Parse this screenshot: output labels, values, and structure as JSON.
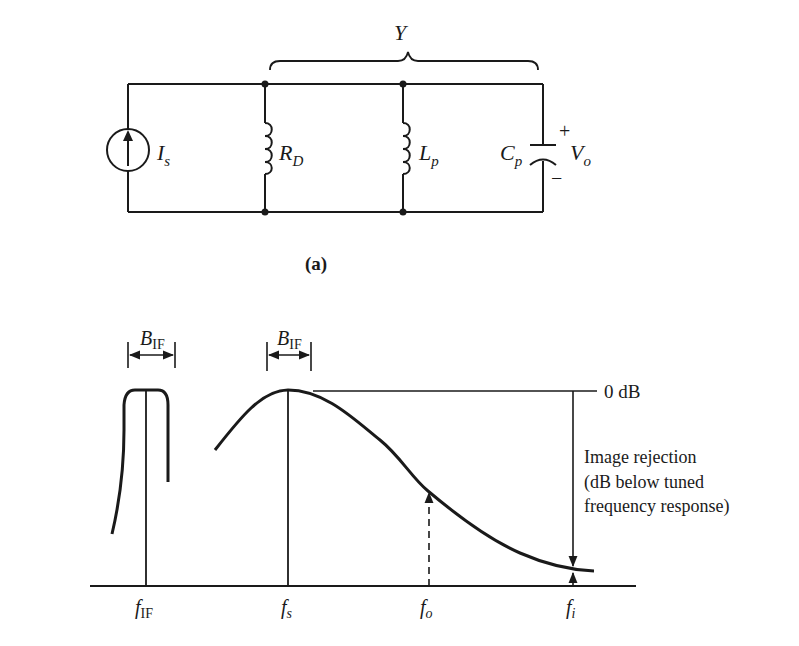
{
  "circuit": {
    "caption": "(a)",
    "bracket_label": "Y",
    "source": {
      "symbol": "I",
      "subscript": "s",
      "icon": "current-source-up-arrow"
    },
    "elements": [
      {
        "id": "rd",
        "symbol": "R",
        "subscript": "D",
        "icon": "coil"
      },
      {
        "id": "lp",
        "symbol": "L",
        "subscript": "p",
        "icon": "coil"
      },
      {
        "id": "cp",
        "symbol": "C",
        "subscript": "p",
        "icon": "capacitor"
      }
    ],
    "output": {
      "symbol": "V",
      "subscript": "o",
      "plus": "+",
      "minus": "−"
    }
  },
  "response_plot": {
    "bandwidth_labels": [
      {
        "symbol": "B",
        "subscript": "IF"
      },
      {
        "symbol": "B",
        "subscript": "IF"
      }
    ],
    "reference_label": "0 dB",
    "annotation_lines": [
      "Image rejection",
      "(dB below tuned",
      "frequency response)"
    ],
    "x_ticks": [
      {
        "symbol": "f",
        "subscript": "IF"
      },
      {
        "symbol": "f",
        "subscript": "s"
      },
      {
        "symbol": "f",
        "subscript": "o"
      },
      {
        "symbol": "f",
        "subscript": "i"
      }
    ]
  }
}
